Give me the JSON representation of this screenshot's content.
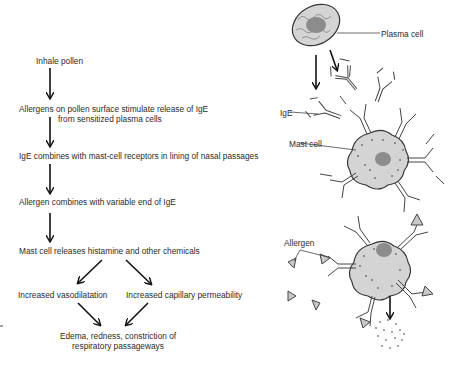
{
  "flowchart": {
    "steps": [
      {
        "id": "inhale",
        "text": "Inhale pollen"
      },
      {
        "id": "allergens-stimulate",
        "line1": "Allergens on pollen surface stimulate release of IgE",
        "line2": "from sensitized plasma cells"
      },
      {
        "id": "ige-combines",
        "text": "IgE combines with mast-cell receptors in lining of nasal passages"
      },
      {
        "id": "allergen-combines",
        "text": "Allergen combines with variable end of IgE"
      },
      {
        "id": "histamine",
        "text": "Mast cell releases histamine and other chemicals"
      },
      {
        "id": "vasodilatation",
        "text": "Increased vasodilatation"
      },
      {
        "id": "permeability",
        "text": "Increased capillary permeability"
      },
      {
        "id": "edema",
        "line1": "Edema, redness, constriction of",
        "line2": "respiratory passageways"
      }
    ]
  },
  "illustration": {
    "labels": {
      "plasma_cell": "Plasma cell",
      "ige": "IgE",
      "mast_cell": "Mast cell",
      "allergen": "Allergen"
    },
    "colors": {
      "cell_fill": "#d6d6d6",
      "nucleus_fill": "#8f8f8f",
      "allergen_fill": "#c8c8c8",
      "line": "#333333"
    }
  }
}
